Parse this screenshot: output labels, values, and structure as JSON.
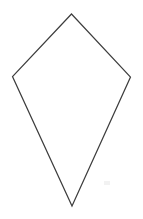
{
  "canvas": {
    "width": 143,
    "height": 219,
    "background_color": "#ffffff",
    "alt_text": "Kite shape outline"
  },
  "shape": {
    "name": "kite",
    "type": "quadrilateral",
    "stroke_color": "#3d3d3d",
    "stroke_width": 1.2,
    "fill_color": "#ffffff",
    "points": "71.5,14 130.5,77 72,206 12.5,76.5",
    "vertices": [
      {
        "label": "top-apex",
        "x": 71.5,
        "y": 14
      },
      {
        "label": "right",
        "x": 130.5,
        "y": 77
      },
      {
        "label": "bottom-apex",
        "x": 72,
        "y": 206
      },
      {
        "label": "left",
        "x": 12.5,
        "y": 76.5
      }
    ]
  },
  "artifacts": {
    "speck": {
      "x": 104,
      "y": 181,
      "width": 6,
      "height": 4,
      "color": "#f2f2f2"
    }
  }
}
